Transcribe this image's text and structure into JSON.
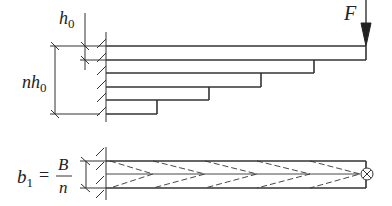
{
  "diagram": {
    "side_view": {
      "label_force": "F",
      "label_h0_main": "h",
      "label_h0_sub": "0",
      "label_nh0_n": "n",
      "label_nh0_h": "h",
      "label_nh0_sub": "0",
      "plate_count": 5,
      "plate_right_ends_px": [
        366,
        314,
        261,
        209,
        157
      ],
      "plate_line_y_px": [
        46,
        60,
        73,
        87,
        100,
        114
      ],
      "wall_x_px": 106
    },
    "top_view": {
      "label_b": "b",
      "label_b_sub": "1",
      "label_equals": "=",
      "label_numerator": "B",
      "label_denominator": "n",
      "load_symbol": "cross-circle",
      "lines_y_px": [
        161,
        174,
        188
      ]
    }
  }
}
